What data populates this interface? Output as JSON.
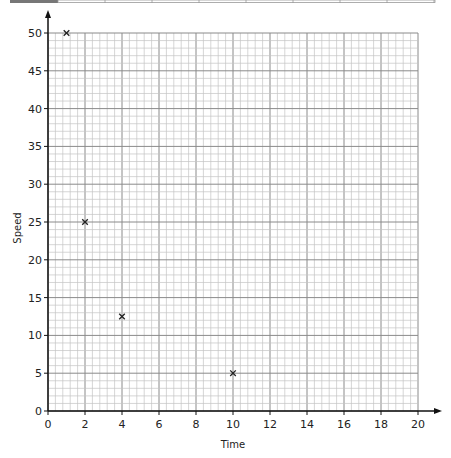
{
  "chart_data": {
    "type": "scatter",
    "title": "",
    "xlabel": "Time",
    "ylabel": "Speed",
    "xlim": [
      0,
      20
    ],
    "ylim": [
      0,
      50
    ],
    "x_ticks": [
      0,
      2,
      4,
      6,
      8,
      10,
      12,
      14,
      16,
      18,
      20
    ],
    "y_ticks": [
      0,
      5,
      10,
      15,
      20,
      25,
      30,
      35,
      40,
      45,
      50
    ],
    "grid": true,
    "marker": "x",
    "points": [
      {
        "x": 1,
        "y": 50
      },
      {
        "x": 2,
        "y": 25
      },
      {
        "x": 4,
        "y": 12.5
      },
      {
        "x": 10,
        "y": 5
      }
    ]
  },
  "colors": {
    "axis": "#111111",
    "grid_major": "#8a8a8a",
    "grid_minor": "#c4c4c4",
    "marker": "#222222",
    "header_block": "#777777"
  }
}
